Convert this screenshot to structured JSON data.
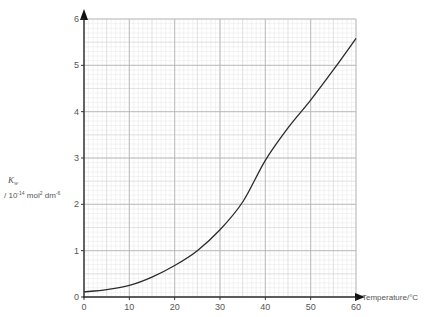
{
  "chart_data": {
    "type": "line",
    "title": "",
    "xlabel": "Temperature/°C",
    "ylabel": {
      "symbol": "K",
      "subscript": "w",
      "units_prefix": "/ 10",
      "units_exp": "-14",
      "units_mid": " mol",
      "units_exp2": "2",
      "units_mid2": " dm",
      "units_exp3": "-6"
    },
    "xlim": [
      0,
      60
    ],
    "ylim": [
      0,
      6
    ],
    "x_ticks": [
      0,
      10,
      20,
      30,
      40,
      50,
      60
    ],
    "y_ticks": [
      0,
      1,
      2,
      3,
      4,
      5,
      6
    ],
    "x_minor_step": 2,
    "y_minor_step": 0.2,
    "grid": true,
    "series": [
      {
        "name": "Kw",
        "x": [
          0,
          5,
          10,
          15,
          20,
          25,
          30,
          35,
          40,
          45,
          50,
          55,
          60
        ],
        "y": [
          0.11,
          0.16,
          0.25,
          0.43,
          0.68,
          1.0,
          1.45,
          2.05,
          2.95,
          3.65,
          4.25,
          4.9,
          5.58
        ]
      }
    ]
  }
}
